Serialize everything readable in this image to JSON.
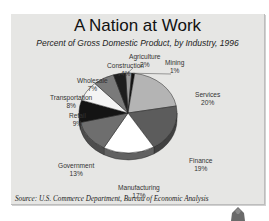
{
  "chart_data": {
    "type": "pie",
    "title": "A Nation at Work",
    "subtitle": "Percent of Gross Domestic Product, by Industry, 1996",
    "categories": [
      "Agriculture",
      "Mining",
      "Services",
      "Finance",
      "Manufacturing",
      "Government",
      "Retail",
      "Transportation",
      "Wholesale",
      "Construction"
    ],
    "values": [
      2,
      1,
      20,
      19,
      17,
      13,
      9,
      8,
      7,
      4
    ],
    "unit": "%",
    "source": "Source:  U.S. Commerce Department, Bureau of Economic Analysis",
    "style": "3d-pie"
  },
  "labels": [
    {
      "name": "Agriculture",
      "pct": "2%"
    },
    {
      "name": "Mining",
      "pct": "1%"
    },
    {
      "name": "Services",
      "pct": "20%"
    },
    {
      "name": "Finance",
      "pct": "19%"
    },
    {
      "name": "Manufacturing",
      "pct": "17%"
    },
    {
      "name": "Government",
      "pct": "13%"
    },
    {
      "name": "Retail",
      "pct": "9%"
    },
    {
      "name": "Transportation",
      "pct": "8%"
    },
    {
      "name": "Wholesale",
      "pct": "7%"
    },
    {
      "name": "Construction",
      "pct": "4%"
    }
  ],
  "colors": {
    "Agriculture": "#9a9a9a",
    "Mining": "#111111",
    "Services": "#b4b4b4",
    "Finance": "#5c5c5c",
    "Manufacturing": "#ffffff",
    "Government": "#6e6e6e",
    "Retail": "#141414",
    "Transportation": "#f4f4f4",
    "Wholesale": "#7a7a7a",
    "Construction": "#1e1e1e"
  }
}
